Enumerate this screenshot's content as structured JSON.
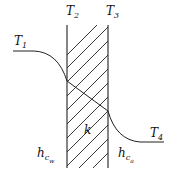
{
  "diagram": {
    "type": "heat-transfer-wall-temperature-profile",
    "labels": {
      "T1": {
        "base": "T",
        "sub": "1"
      },
      "T2": {
        "base": "T",
        "sub": "2"
      },
      "T3": {
        "base": "T",
        "sub": "3"
      },
      "T4": {
        "base": "T",
        "sub": "4"
      },
      "k": {
        "base": "k"
      },
      "hcw": {
        "base": "h",
        "sub": "c",
        "subsub": "w"
      },
      "hca": {
        "base": "h",
        "sub": "c",
        "subsub": "a"
      }
    },
    "wall": {
      "left_x": 67,
      "right_x": 108,
      "top_y": 25,
      "bottom_y": 168,
      "hatch": "diagonal"
    },
    "colors": {
      "stroke": "#222222",
      "background": "#ffffff"
    }
  }
}
